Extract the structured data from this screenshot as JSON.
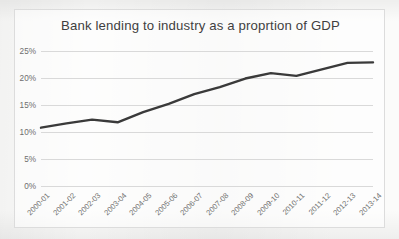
{
  "chart_data": {
    "type": "line",
    "title": "Bank lending to industry as a proprtion of GDP",
    "xlabel": "",
    "ylabel": "",
    "categories": [
      "2000-01",
      "2001-02",
      "2002-03",
      "2003-04",
      "2004-05",
      "2005-06",
      "2006-07",
      "2007-08",
      "2008-09",
      "2009-10",
      "2010-11",
      "2011-12",
      "2012-13",
      "2013-14"
    ],
    "values": [
      10.8,
      11.6,
      12.3,
      11.8,
      13.7,
      15.2,
      17.0,
      18.3,
      19.9,
      20.9,
      20.4,
      21.6,
      22.8,
      22.9
    ],
    "series": [
      {
        "name": "Bank lending to industry as a proprtion of GDP",
        "values": [
          10.8,
          11.6,
          12.3,
          11.8,
          13.7,
          15.2,
          17.0,
          18.3,
          19.9,
          20.9,
          20.4,
          21.6,
          22.8,
          22.9
        ]
      }
    ],
    "ylim": [
      0,
      25
    ],
    "ytick_values": [
      0,
      5,
      10,
      15,
      20,
      25
    ],
    "ytick_labels": [
      "0%",
      "5%",
      "10%",
      "15%",
      "20%",
      "25%"
    ],
    "grid": true,
    "legend": false,
    "legend_position": "none",
    "value_suffix": "%",
    "colors": {
      "line": "#3a3a3a",
      "gridline": "#d9d9d9",
      "title_text": "#3f3f3f",
      "tick_text": "#6e6e6e",
      "frame_border": "#dcdcdc",
      "background": "#fbfbfa"
    }
  },
  "background_artifacts": {
    "top_line": "",
    "mid_line": "",
    "bottom_line": ""
  }
}
